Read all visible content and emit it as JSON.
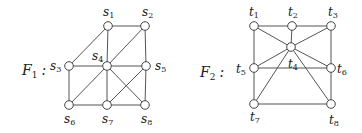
{
  "graphs": [
    {
      "name": "F",
      "index": "1",
      "label_pos": [
        22,
        75
      ],
      "nodes": [
        {
          "id": "s1",
          "letter": "s",
          "sub": "1",
          "x": 108,
          "y": 26,
          "lx": 103,
          "ly": 16
        },
        {
          "id": "s2",
          "letter": "s",
          "sub": "2",
          "x": 145,
          "y": 26,
          "lx": 142,
          "ly": 16
        },
        {
          "id": "s3",
          "letter": "s",
          "sub": "3",
          "x": 69,
          "y": 66,
          "lx": 50,
          "ly": 70
        },
        {
          "id": "s4",
          "letter": "s",
          "sub": "4",
          "x": 107,
          "y": 66,
          "lx": 92,
          "ly": 60
        },
        {
          "id": "s5",
          "letter": "s",
          "sub": "5",
          "x": 146,
          "y": 66,
          "lx": 155,
          "ly": 70
        },
        {
          "id": "s6",
          "letter": "s",
          "sub": "6",
          "x": 69,
          "y": 105,
          "lx": 64,
          "ly": 123
        },
        {
          "id": "s7",
          "letter": "s",
          "sub": "7",
          "x": 107,
          "y": 105,
          "lx": 102,
          "ly": 123
        },
        {
          "id": "s8",
          "letter": "s",
          "sub": "8",
          "x": 145,
          "y": 105,
          "lx": 141,
          "ly": 123
        }
      ],
      "edges": [
        [
          "s1",
          "s2"
        ],
        [
          "s1",
          "s3"
        ],
        [
          "s1",
          "s4"
        ],
        [
          "s2",
          "s4"
        ],
        [
          "s2",
          "s5"
        ],
        [
          "s3",
          "s4"
        ],
        [
          "s4",
          "s5"
        ],
        [
          "s3",
          "s6"
        ],
        [
          "s4",
          "s6"
        ],
        [
          "s4",
          "s7"
        ],
        [
          "s4",
          "s8"
        ],
        [
          "s5",
          "s7"
        ],
        [
          "s5",
          "s8"
        ],
        [
          "s6",
          "s7"
        ],
        [
          "s7",
          "s8"
        ]
      ]
    },
    {
      "name": "F",
      "index": "2",
      "label_pos": [
        200,
        77
      ],
      "nodes": [
        {
          "id": "t1",
          "letter": "t",
          "sub": "1",
          "x": 254,
          "y": 26,
          "lx": 249,
          "ly": 16
        },
        {
          "id": "t2",
          "letter": "t",
          "sub": "2",
          "x": 292,
          "y": 26,
          "lx": 288,
          "ly": 16
        },
        {
          "id": "t3",
          "letter": "t",
          "sub": "3",
          "x": 331,
          "y": 26,
          "lx": 328,
          "ly": 16
        },
        {
          "id": "t4",
          "letter": "t",
          "sub": "4",
          "x": 291,
          "y": 47,
          "lx": 288,
          "ly": 68
        },
        {
          "id": "t5",
          "letter": "t",
          "sub": "5",
          "x": 254,
          "y": 68,
          "lx": 236,
          "ly": 73
        },
        {
          "id": "t6",
          "letter": "t",
          "sub": "6",
          "x": 331,
          "y": 68,
          "lx": 337,
          "ly": 73
        },
        {
          "id": "t7",
          "letter": "t",
          "sub": "7",
          "x": 254,
          "y": 104,
          "lx": 250,
          "ly": 121
        },
        {
          "id": "t8",
          "letter": "t",
          "sub": "8",
          "x": 331,
          "y": 104,
          "lx": 329,
          "ly": 124
        }
      ],
      "edges": [
        [
          "t1",
          "t2"
        ],
        [
          "t2",
          "t3"
        ],
        [
          "t1",
          "t5"
        ],
        [
          "t5",
          "t7"
        ],
        [
          "t3",
          "t6"
        ],
        [
          "t6",
          "t8"
        ],
        [
          "t7",
          "t8"
        ],
        [
          "t5",
          "t6"
        ],
        [
          "t2",
          "t4"
        ],
        [
          "t1",
          "t4"
        ],
        [
          "t3",
          "t4"
        ],
        [
          "t4",
          "t5"
        ],
        [
          "t4",
          "t6"
        ],
        [
          "t4",
          "t7"
        ],
        [
          "t4",
          "t8"
        ]
      ]
    }
  ],
  "colors": {
    "edge": "#555555",
    "node_stroke": "#444444",
    "node_fill": "#ffffff",
    "text": "#222222"
  }
}
